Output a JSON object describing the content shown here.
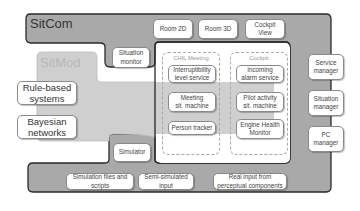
{
  "sitcom": {
    "title": "SitCom",
    "top_boxes": [
      "Room 2D",
      "Room 3D",
      "Cockpit\nView"
    ],
    "situation_monitor": "Situation\nmonitor",
    "right_boxes": [
      "Service\nmanager",
      "Situation\nmanager",
      "PC\nmanager"
    ],
    "simulator": "Simulator",
    "bottom_boxes": [
      "Simulation files and\nscripts",
      "Semi-simulated\ninput",
      "Real input from\nperceptual components"
    ]
  },
  "sitmod": {
    "title": "SitMod",
    "left_boxes": [
      "Rule-based\nsystems",
      "Bayesian\nnetworks"
    ]
  },
  "groups": [
    {
      "label": "CHIL Meeting",
      "services": [
        "Interruptibility\nlevel service"
      ],
      "sitmod_items": [
        "Meeting\nsit. machine",
        "Person tracker"
      ]
    },
    {
      "label": "Cockpit",
      "services": [
        "Incoming\nalarm service"
      ],
      "sitmod_items": [
        "Pilot activity\nsit. machine",
        "Engine Health\nMonitor"
      ]
    }
  ],
  "colors": {
    "sitcom_fill": "#a9a9a9",
    "sitcom_border": "#2a2a2a",
    "sitmod_fill": "#cfcfcf",
    "box_fill": "#ffffff"
  }
}
